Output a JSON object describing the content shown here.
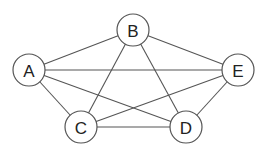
{
  "graph": {
    "type": "complete-graph",
    "nodes": [
      {
        "id": "A",
        "label": "A",
        "x": 29,
        "y": 70
      },
      {
        "id": "B",
        "label": "B",
        "x": 133,
        "y": 30
      },
      {
        "id": "E",
        "label": "E",
        "x": 238,
        "y": 70
      },
      {
        "id": "C",
        "label": "C",
        "x": 81,
        "y": 127
      },
      {
        "id": "D",
        "label": "D",
        "x": 186,
        "y": 127
      }
    ],
    "edges": [
      [
        "A",
        "B"
      ],
      [
        "A",
        "E"
      ],
      [
        "A",
        "C"
      ],
      [
        "A",
        "D"
      ],
      [
        "B",
        "E"
      ],
      [
        "B",
        "C"
      ],
      [
        "B",
        "D"
      ],
      [
        "C",
        "E"
      ],
      [
        "C",
        "D"
      ],
      [
        "D",
        "E"
      ]
    ],
    "node_radius": 16,
    "colors": {
      "stroke": "#555555",
      "fill": "#ffffff",
      "text": "#222222"
    }
  }
}
